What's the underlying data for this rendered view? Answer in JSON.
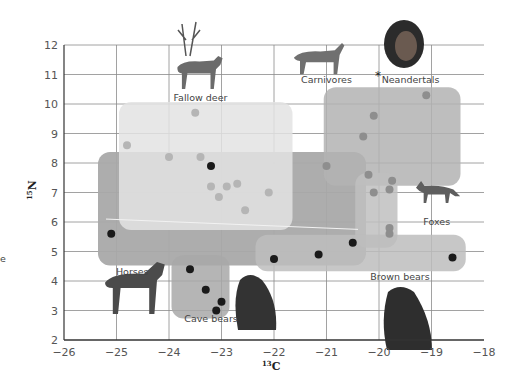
{
  "chart_data": {
    "type": "scatter",
    "title": "",
    "xlabel": "13C",
    "ylabel": "15N",
    "xlim": [
      -26,
      -18
    ],
    "ylim": [
      2,
      12
    ],
    "x_ticks": [
      "−26",
      "−25",
      "−24",
      "−23",
      "−22",
      "−21",
      "−20",
      "−19",
      "−18"
    ],
    "y_ticks": [
      "2",
      "3",
      "4",
      "5",
      "6",
      "7",
      "8",
      "9",
      "10",
      "11",
      "12"
    ],
    "grid": true,
    "groups": [
      {
        "name": "Fallow deer",
        "fill": "#e3e3e3",
        "box": [
          -24.8,
          -21.8,
          9.8,
          6.0
        ],
        "points": [
          [
            -23.5,
            9.7
          ],
          [
            -24.8,
            8.6
          ],
          [
            -24,
            8.2
          ],
          [
            -23.4,
            8.2
          ],
          [
            -23.2,
            7.2
          ],
          [
            -22.9,
            7.2
          ],
          [
            -23.05,
            6.85
          ],
          [
            -22.7,
            7.3
          ],
          [
            -22.55,
            6.4
          ],
          [
            -22.1,
            7
          ]
        ]
      },
      {
        "name": "Horses",
        "fill": "#a9a9a9",
        "box": [
          -25.2,
          -20.4,
          8.1,
          4.8
        ],
        "points": [
          [
            -23.2,
            7.9
          ],
          [
            -25.1,
            5.6
          ],
          [
            -20.5,
            5.3
          ]
        ]
      },
      {
        "name": "Carnivores",
        "fill": "#b3b3b3",
        "box": [
          -20.9,
          -18.6,
          10.3,
          7.5
        ],
        "points": [
          [
            -19.1,
            10.3
          ],
          [
            -20.1,
            9.6
          ],
          [
            -20.3,
            8.9
          ],
          [
            -21,
            7.9
          ],
          [
            -20.2,
            7.6
          ]
        ]
      },
      {
        "name": "Foxes",
        "fill": "#c0c0c0",
        "box": [
          -20.3,
          -19.8,
          7.4,
          5.4
        ],
        "points": [
          [
            -20.1,
            7
          ],
          [
            -19.8,
            7.1
          ],
          [
            -19.75,
            7.4
          ],
          [
            -19.8,
            5.8
          ],
          [
            -19.8,
            5.6
          ]
        ]
      },
      {
        "name": "Brown bears",
        "fill": "#bdbdbd",
        "box": [
          -22.2,
          -18.5,
          5.3,
          4.6
        ],
        "points": [
          [
            -22,
            4.75
          ],
          [
            -21.15,
            4.9
          ],
          [
            -18.6,
            4.8
          ]
        ]
      },
      {
        "name": "Cave bears",
        "fill": "#a8a8a8",
        "box": [
          -23.8,
          -23,
          4.6,
          3.0
        ],
        "points": [
          [
            -23.6,
            4.4
          ],
          [
            -23.3,
            3.7
          ],
          [
            -23,
            3.3
          ],
          [
            -23.1,
            3
          ]
        ]
      }
    ],
    "labels": [
      {
        "text": "Fallow deer",
        "x": -23.4,
        "y": 10.1
      },
      {
        "text": "Carnivores",
        "x": -21.0,
        "y": 10.7
      },
      {
        "text": "Neandertals",
        "x": -19.4,
        "y": 10.7
      },
      {
        "text": "Foxes",
        "x": -18.9,
        "y": 5.9
      },
      {
        "text": "Horses",
        "x": -24.7,
        "y": 4.2
      },
      {
        "text": "Cave bears",
        "x": -23.2,
        "y": 2.6
      },
      {
        "text": "Brown bears",
        "x": -19.6,
        "y": 4.05
      }
    ],
    "neandertal_marker": {
      "x": -20,
      "y": 11,
      "symbol": "*"
    }
  },
  "legend_fragment": "e"
}
